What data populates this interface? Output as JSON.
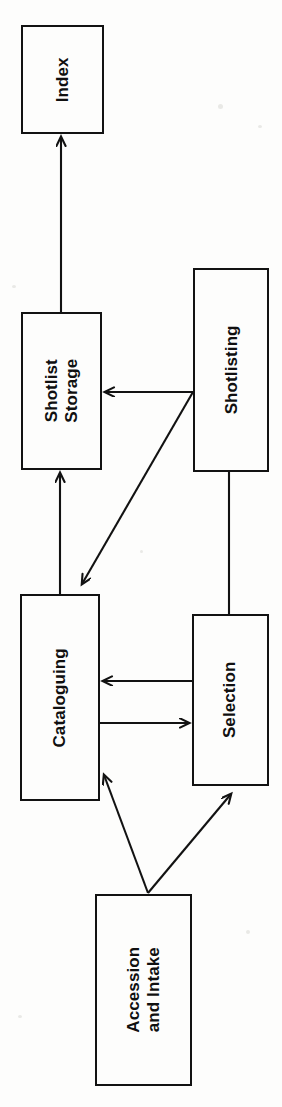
{
  "diagram": {
    "type": "flowchart",
    "orientation": "rotated-90-counterclockwise",
    "canvas": {
      "width": 282,
      "height": 1107
    },
    "background_color": "#fdfdfc",
    "line_color": "#121212",
    "nodes": [
      {
        "id": "index",
        "label": "Index",
        "x": 21,
        "y": 25,
        "width": 83,
        "height": 109
      },
      {
        "id": "shotlist-storage",
        "label": "Shotlist\nStorage",
        "x": 21,
        "y": 312,
        "width": 81,
        "height": 158
      },
      {
        "id": "shotlisting",
        "label": "Shotlisting",
        "x": 193,
        "y": 268,
        "width": 76,
        "height": 204
      },
      {
        "id": "cataloguing",
        "label": "Cataloguing",
        "x": 20,
        "y": 594,
        "width": 80,
        "height": 207
      },
      {
        "id": "selection",
        "label": "Selection",
        "x": 192,
        "y": 614,
        "width": 77,
        "height": 172
      },
      {
        "id": "accession-and-intake",
        "label": "Accession\nand Intake",
        "x": 95,
        "y": 894,
        "width": 97,
        "height": 192
      }
    ],
    "edges": [
      {
        "id": "shotlist-storage-to-index",
        "from": "shotlist-storage",
        "to": "index",
        "arrowhead": "to",
        "points": "61,312 61,137"
      },
      {
        "id": "shotlisting-to-shotlist-storage",
        "from": "shotlisting",
        "to": "shotlist-storage",
        "arrowhead": "to",
        "points": "193,392 105,392"
      },
      {
        "id": "cataloguing-to-shotlist-storage",
        "from": "cataloguing",
        "to": "shotlist-storage",
        "arrowhead": "to",
        "points": "60,594 60,473"
      },
      {
        "id": "shotlisting-to-cataloguing",
        "from": "shotlisting",
        "to": "cataloguing",
        "arrowhead": "to",
        "points": "193,392 82,584"
      },
      {
        "id": "shotlisting-to-selection",
        "from": "shotlisting",
        "to": "selection",
        "arrowhead": "none",
        "points": "229,472 229,614"
      },
      {
        "id": "selection-to-cataloguing",
        "from": "selection",
        "to": "cataloguing",
        "arrowhead": "to",
        "points": "192,681 103,681"
      },
      {
        "id": "cataloguing-to-selection",
        "from": "cataloguing",
        "to": "selection",
        "arrowhead": "to",
        "points": "100,723 189,723"
      },
      {
        "id": "accession-to-cataloguing",
        "from": "accession-and-intake",
        "to": "cataloguing",
        "arrowhead": "to",
        "points": "148,893 104,775"
      },
      {
        "id": "accession-to-selection",
        "from": "accession-and-intake",
        "to": "selection",
        "arrowhead": "to",
        "points": "148,893 231,794"
      }
    ]
  }
}
